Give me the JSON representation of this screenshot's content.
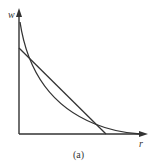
{
  "figure": {
    "caption": "(a)",
    "y_axis_label": "w",
    "x_axis_label": "r",
    "colors": {
      "stroke": "#333333",
      "background": "#ffffff"
    },
    "elements": [
      {
        "name": "convex-curve",
        "description": "downward-sloping convex curve, decreasing from high w near r=0 toward the r axis"
      },
      {
        "name": "straight-line",
        "description": "downward-sloping straight line from the w axis to the r axis, crossing the curve twice"
      }
    ]
  }
}
